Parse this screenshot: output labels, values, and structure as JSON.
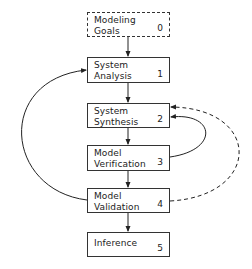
{
  "diagram": {
    "nodes": [
      {
        "id": 0,
        "label": "Modeling\nGoals",
        "number": "0",
        "style": "dashed"
      },
      {
        "id": 1,
        "label": "System\nAnalysis",
        "number": "1",
        "style": "solid"
      },
      {
        "id": 2,
        "label": "System\nSynthesis",
        "number": "2",
        "style": "solid"
      },
      {
        "id": 3,
        "label": "Model\nVerification",
        "number": "3",
        "style": "solid"
      },
      {
        "id": 4,
        "label": "Model\nValidation",
        "number": "4",
        "style": "solid"
      },
      {
        "id": 5,
        "label": "Inference",
        "number": "5",
        "style": "solid"
      }
    ],
    "edges": [
      {
        "from": 0,
        "to": 1,
        "style": "solid",
        "shape": "straight"
      },
      {
        "from": 1,
        "to": 2,
        "style": "solid",
        "shape": "straight"
      },
      {
        "from": 2,
        "to": 3,
        "style": "solid",
        "shape": "straight"
      },
      {
        "from": 3,
        "to": 4,
        "style": "solid",
        "shape": "straight"
      },
      {
        "from": 4,
        "to": 5,
        "style": "solid",
        "shape": "straight"
      },
      {
        "from": 4,
        "to": 1,
        "style": "solid",
        "shape": "curved-left"
      },
      {
        "from": 3,
        "to": 2,
        "style": "solid",
        "shape": "curved-right"
      },
      {
        "from": 4,
        "to": 2,
        "style": "dashed",
        "shape": "curved-right"
      }
    ],
    "colors": {
      "stroke": "#333333",
      "background": "#ffffff"
    }
  }
}
